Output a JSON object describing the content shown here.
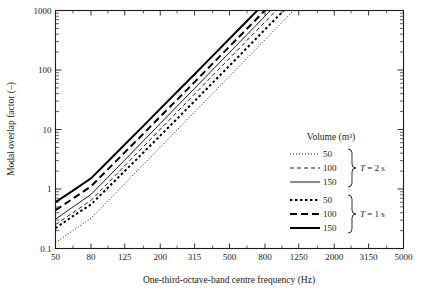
{
  "chart_data": {
    "type": "line",
    "title": "",
    "xlabel": "One-third-octave-band centre frequency (Hz)",
    "ylabel": "Modal overlap factor (–)",
    "xscale": "log",
    "yscale": "log",
    "xlim": [
      50,
      5000
    ],
    "ylim": [
      0.1,
      1000
    ],
    "grid": false,
    "legend_position": "inside-right",
    "x_tick_labels": [
      "50",
      "80",
      "125",
      "200",
      "315",
      "500",
      "800",
      "1250",
      "2000",
      "3150",
      "5000"
    ],
    "x_tick_values": [
      50,
      80,
      125,
      200,
      315,
      500,
      800,
      1250,
      2000,
      3150,
      5000
    ],
    "x_minor_tick_values": [
      63,
      100,
      160,
      250,
      400,
      630,
      1000,
      1600,
      2500,
      4000
    ],
    "y_tick_labels": [
      "0.1",
      "1",
      "10",
      "100",
      "1000"
    ],
    "y_tick_values": [
      0.1,
      1,
      10,
      100,
      1000
    ],
    "x": [
      50,
      63,
      80,
      100,
      125,
      160,
      200,
      250,
      315,
      400,
      500,
      630,
      800,
      1000,
      1250,
      1600,
      2000,
      2500,
      3150,
      4000,
      5000
    ],
    "series": [
      {
        "name": "V = 50 m³, T = 2 s",
        "volume": 50,
        "reverberation_time_s": 2,
        "style": "dotted",
        "width": "thin",
        "values": [
          0.126,
          0.2,
          0.323,
          0.63,
          1.23,
          2.58,
          5.04,
          9.84,
          19.7,
          40.3,
          78.7,
          157,
          322,
          630,
          1230,
          2580,
          5040,
          9840,
          19700,
          40300,
          78700
        ]
      },
      {
        "name": "V = 100 m³, T = 2 s",
        "volume": 100,
        "reverberation_time_s": 2,
        "style": "dashed",
        "width": "thin",
        "values": [
          0.252,
          0.4,
          0.645,
          1.26,
          2.46,
          5.16,
          10.1,
          19.7,
          39.4,
          80.6,
          157,
          314,
          645,
          1260,
          2460,
          5160,
          10100,
          19700,
          39400,
          80600,
          157000
        ]
      },
      {
        "name": "V = 150 m³, T = 2 s",
        "volume": 150,
        "reverberation_time_s": 2,
        "style": "solid",
        "width": "thin",
        "values": [
          0.31,
          0.5,
          0.81,
          1.57,
          3.07,
          6.45,
          12.6,
          24.6,
          49.2,
          101,
          197,
          393,
          806,
          1570,
          3070,
          6450,
          12600,
          24600,
          49200,
          101000,
          197000
        ]
      },
      {
        "name": "V = 50 m³, T = 1 s",
        "volume": 50,
        "reverberation_time_s": 1,
        "style": "dotted",
        "width": "thick",
        "values": [
          0.22,
          0.35,
          0.55,
          1.05,
          2.0,
          4.1,
          7.9,
          15.2,
          30.0,
          61.0,
          118,
          235,
          480,
          930,
          1810,
          3790,
          7390,
          14400,
          28900,
          59100,
          115000
        ]
      },
      {
        "name": "V = 100 m³, T = 1 s",
        "volume": 100,
        "reverberation_time_s": 1,
        "style": "dashed",
        "width": "thick",
        "values": [
          0.44,
          0.69,
          1.11,
          2.14,
          4.12,
          8.5,
          16.5,
          31.8,
          62.7,
          128,
          248,
          493,
          1008,
          1960,
          3810,
          7960,
          15500,
          30200,
          60700,
          124000,
          242000
        ]
      },
      {
        "name": "V = 150 m³, T = 1 s",
        "volume": 150,
        "reverberation_time_s": 1,
        "style": "solid",
        "width": "thick",
        "values": [
          0.6,
          0.94,
          1.51,
          2.9,
          5.58,
          11.5,
          22.3,
          43.0,
          84.7,
          173,
          335,
          666,
          1360,
          2650,
          5150,
          10760,
          20900,
          40800,
          82000,
          168000,
          327000
        ]
      }
    ]
  },
  "axes": {
    "x_title": "One-third-octave-band centre frequency (Hz)",
    "y_title": "Modal overlap factor (–)",
    "x_ticks": [
      "50",
      "80",
      "125",
      "200",
      "315",
      "500",
      "800",
      "1250",
      "2000",
      "3150",
      "5000"
    ],
    "y_ticks": [
      "1000",
      "100",
      "10",
      "1",
      "0.1"
    ]
  },
  "legend": {
    "title": "Volume (m³)",
    "groups": [
      {
        "label": "T = 2 s",
        "label_italic_part": "T",
        "label_rest": " = 2 s",
        "entries": [
          {
            "label": "50",
            "style": "dotted",
            "width": "thin"
          },
          {
            "label": "100",
            "style": "dashed",
            "width": "thin"
          },
          {
            "label": "150",
            "style": "solid",
            "width": "thin"
          }
        ]
      },
      {
        "label": "T = 1 s",
        "label_italic_part": "T",
        "label_rest": " = 1 s",
        "entries": [
          {
            "label": "50",
            "style": "dotted",
            "width": "thick"
          },
          {
            "label": "100",
            "style": "dashed",
            "width": "thick"
          },
          {
            "label": "150",
            "style": "solid",
            "width": "thick"
          }
        ]
      }
    ]
  },
  "colors": {
    "background": "#ffffff",
    "ink": "#1a1a1a",
    "curve": "#000000"
  }
}
